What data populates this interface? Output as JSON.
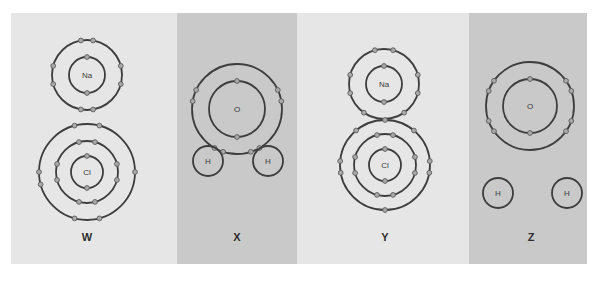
{
  "figure": {
    "panels": [
      {
        "id": "W",
        "label": "W",
        "shade": "light",
        "atoms": [
          {
            "symbol": "Na",
            "cx": 87,
            "cy": 75,
            "shells": [
              18,
              35
            ],
            "electrons": [
              [
                1,
                90
              ],
              [
                1,
                270
              ],
              [
                2,
                80
              ],
              [
                2,
                100
              ],
              [
                2,
                260
              ],
              [
                2,
                280
              ],
              [
                2,
                165
              ],
              [
                2,
                195
              ],
              [
                2,
                345
              ],
              [
                2,
                15
              ]
            ]
          },
          {
            "symbol": "Cl",
            "cx": 87,
            "cy": 172,
            "shells": [
              16,
              31,
              48
            ],
            "electrons": [
              [
                1,
                90
              ],
              [
                1,
                270
              ],
              [
                2,
                75
              ],
              [
                2,
                105
              ],
              [
                2,
                255
              ],
              [
                2,
                285
              ],
              [
                2,
                165
              ],
              [
                2,
                195
              ],
              [
                2,
                345
              ],
              [
                2,
                15
              ],
              [
                3,
                75
              ],
              [
                3,
                105
              ],
              [
                3,
                255
              ],
              [
                3,
                285
              ],
              [
                3,
                180
              ],
              [
                3,
                0
              ],
              [
                3,
                195
              ]
            ]
          }
        ]
      },
      {
        "id": "X",
        "label": "X",
        "shade": "dark",
        "atoms": [
          {
            "symbol": "O",
            "cx": 237,
            "cy": 109,
            "shells": [
              28,
              45
            ],
            "electrons": [
              [
                1,
                90
              ],
              [
                1,
                270
              ],
              [
                2,
                155
              ],
              [
                2,
                170
              ],
              [
                2,
                25
              ],
              [
                2,
                10
              ],
              [
                2,
                240
              ],
              [
                2,
                252
              ],
              [
                2,
                300
              ],
              [
                2,
                288
              ]
            ]
          },
          {
            "symbol": "H",
            "cx": 208,
            "cy": 161,
            "shells": [
              15
            ],
            "electrons": []
          },
          {
            "symbol": "H",
            "cx": 268,
            "cy": 161,
            "shells": [
              15
            ],
            "electrons": []
          }
        ]
      },
      {
        "id": "Y",
        "label": "Y",
        "shade": "light",
        "atoms": [
          {
            "symbol": "Na",
            "cx": 384,
            "cy": 84,
            "shells": [
              18,
              35
            ],
            "electrons": [
              [
                1,
                90
              ],
              [
                1,
                270
              ],
              [
                2,
                75
              ],
              [
                2,
                105
              ],
              [
                2,
                165
              ],
              [
                2,
                195
              ],
              [
                2,
                345
              ],
              [
                2,
                15
              ],
              [
                2,
                235
              ],
              [
                2,
                305
              ]
            ]
          },
          {
            "symbol": "Cl",
            "cx": 385,
            "cy": 165,
            "shells": [
              16,
              31,
              45
            ],
            "electrons": [
              [
                1,
                90
              ],
              [
                1,
                270
              ],
              [
                2,
                75
              ],
              [
                2,
                105
              ],
              [
                2,
                255
              ],
              [
                2,
                285
              ],
              [
                2,
                165
              ],
              [
                2,
                195
              ],
              [
                2,
                345
              ],
              [
                2,
                15
              ],
              [
                3,
                90
              ],
              [
                3,
                270
              ],
              [
                3,
                175
              ],
              [
                3,
                5
              ],
              [
                3,
                130
              ],
              [
                3,
                50
              ],
              [
                3,
                190
              ],
              [
                3,
                350
              ]
            ]
          }
        ]
      },
      {
        "id": "Z",
        "label": "Z",
        "shade": "dark",
        "atoms": [
          {
            "symbol": "O",
            "cx": 530,
            "cy": 106,
            "shells": [
              27,
              44
            ],
            "electrons": [
              [
                1,
                90
              ],
              [
                1,
                270
              ],
              [
                2,
                145
              ],
              [
                2,
                160
              ],
              [
                2,
                35
              ],
              [
                2,
                20
              ],
              [
                2,
                200
              ],
              [
                2,
                215
              ],
              [
                2,
                325
              ],
              [
                2,
                340
              ]
            ]
          },
          {
            "symbol": "H",
            "cx": 498,
            "cy": 193,
            "shells": [
              15
            ],
            "electrons": []
          },
          {
            "symbol": "H",
            "cx": 567,
            "cy": 193,
            "shells": [
              15
            ],
            "electrons": []
          }
        ]
      }
    ],
    "label_y": 237,
    "colors": {
      "panel_light": "#e6e6e6",
      "panel_dark": "#c9c9c9",
      "shell": "#3d3d3d",
      "electron": "#aaaaaa"
    }
  }
}
